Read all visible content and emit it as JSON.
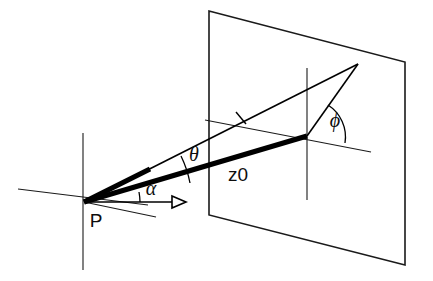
{
  "figure": {
    "type": "geometry-diagram",
    "background_color": "#ffffff",
    "stroke_color": "#000000",
    "width": 433,
    "height": 281
  },
  "labels": {
    "origin_point": "P",
    "azimuth_angle": "α",
    "elevation_angle": "θ",
    "plane_angle": "ϕ",
    "distance": "z0"
  },
  "label_positions": {
    "origin_point": {
      "x": 96,
      "y": 221
    },
    "azimuth_angle": {
      "x": 150,
      "y": 190
    },
    "elevation_angle": {
      "x": 193,
      "y": 155
    },
    "plane_angle": {
      "x": 334,
      "y": 121
    },
    "distance": {
      "x": 237,
      "y": 175
    }
  },
  "geometry": {
    "origin": {
      "x": 84,
      "y": 202
    },
    "plane_intersection": {
      "x": 307,
      "y": 136
    },
    "ray_apex": {
      "x": 358,
      "y": 64
    },
    "plane_corners": {
      "top_left": {
        "x": 209,
        "y": 11
      },
      "top_right": {
        "x": 405,
        "y": 62
      },
      "bottom_right": {
        "x": 405,
        "y": 265
      },
      "bottom_left": {
        "x": 209,
        "y": 215
      }
    },
    "axis_vertical_at_origin": {
      "x": 83,
      "y1": 133,
      "y2": 270
    },
    "axis_horizontal_at_origin": {
      "x1": 18,
      "y1": 189,
      "x2": 148,
      "y2": 205
    },
    "axis_depth_at_origin": {
      "x1": 84,
      "y1": 202,
      "x2": 155,
      "y2": 216
    },
    "alpha_arrow": {
      "x1": 84,
      "y1": 202,
      "x2": 180,
      "y2": 202
    },
    "plane_vertical_axis": {
      "x": 307,
      "y1": 68,
      "y2": 200
    },
    "plane_horizontal_axis": {
      "x1": 205,
      "y1": 120,
      "x2": 371,
      "y2": 152
    },
    "tick_on_thin_ray": {
      "x": 241,
      "y": 118
    }
  },
  "arcs": {
    "alpha": {
      "radius": 56,
      "start_deg": 0,
      "end_deg": 10
    },
    "theta": {
      "radius": 108,
      "start_deg": 10,
      "end_deg": 26
    },
    "phi": {
      "radius": 38,
      "start_deg": 0,
      "end_deg": 55
    }
  }
}
